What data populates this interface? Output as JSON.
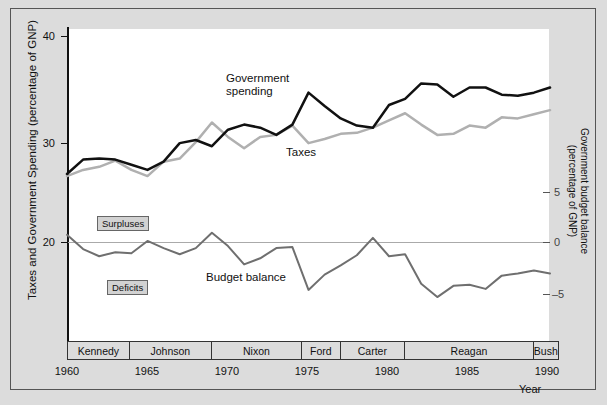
{
  "axes": {
    "left_title": "Taxes and Government Spending  (percentage of GNP)",
    "left_ticks": [
      "40",
      "30",
      "20"
    ],
    "right_title_line1": "Government budget balance",
    "right_title_line2": "(percentage of GNP)",
    "right_ticks": [
      "5",
      "0",
      "–5"
    ],
    "x_title": "Year",
    "x_ticks": [
      "1960",
      "1965",
      "1970",
      "1975",
      "1980",
      "1985",
      "1990"
    ]
  },
  "annotations": {
    "spending_line1": "Government",
    "spending_line2": "spending",
    "taxes": "Taxes",
    "budget_balance": "Budget balance",
    "surpluses": "Surpluses",
    "deficits": "Deficits"
  },
  "presidents": [
    {
      "name": "Kennedy",
      "start": 1960,
      "end": 1963.9
    },
    {
      "name": "Johnson",
      "start": 1963.9,
      "end": 1969
    },
    {
      "name": "Nixon",
      "start": 1969,
      "end": 1974.6
    },
    {
      "name": "Ford",
      "start": 1974.6,
      "end": 1977
    },
    {
      "name": "Carter",
      "start": 1977,
      "end": 1981
    },
    {
      "name": "Reagan",
      "start": 1981,
      "end": 1989
    },
    {
      "name": "Bush",
      "start": 1989,
      "end": 1990
    }
  ],
  "colors": {
    "spending": "#111111",
    "taxes": "#b0b0b0",
    "balance": "#6f6f6f",
    "frame": "#555555",
    "plot_bg": "#ffffff",
    "page_bg": "#dcdcdc"
  },
  "chart_data": {
    "type": "line",
    "title": "",
    "xlabel": "Year",
    "ylabel": "Taxes and Government Spending  (percentage of GNP)",
    "y2label": "Government budget balance (percentage of GNP)",
    "xlim": [
      1960,
      1990
    ],
    "ylim": [
      16.5,
      41.5
    ],
    "y2lim": [
      -8.5,
      6.5
    ],
    "yticks": [
      20,
      30,
      40
    ],
    "y2ticks": [
      -5,
      0,
      5
    ],
    "xticks": [
      1960,
      1965,
      1970,
      1975,
      1980,
      1985,
      1990
    ],
    "grid": false,
    "legend": "inline-annotations",
    "x": [
      1960,
      1961,
      1962,
      1963,
      1964,
      1965,
      1966,
      1967,
      1968,
      1969,
      1970,
      1971,
      1972,
      1973,
      1974,
      1975,
      1976,
      1977,
      1978,
      1979,
      1980,
      1981,
      1982,
      1983,
      1984,
      1985,
      1986,
      1987,
      1988,
      1989,
      1990
    ],
    "series": [
      {
        "name": "Government spending",
        "axis": "left",
        "color": "#111111",
        "values": [
          26.6,
          28.0,
          28.1,
          28.0,
          27.5,
          27.0,
          27.8,
          29.6,
          29.9,
          29.3,
          30.9,
          31.4,
          31.1,
          30.4,
          31.4,
          34.5,
          33.2,
          32.0,
          31.3,
          31.1,
          33.3,
          33.9,
          35.4,
          35.3,
          34.1,
          35.0,
          35.0,
          34.3,
          34.2,
          34.5,
          35.0
        ],
        "marker": "none",
        "linewidth": 2.5
      },
      {
        "name": "Taxes",
        "axis": "left",
        "color": "#b0b0b0",
        "values": [
          26.4,
          27.0,
          27.3,
          27.9,
          27.0,
          26.4,
          27.8,
          28.1,
          29.7,
          31.6,
          30.2,
          29.1,
          30.2,
          30.4,
          31.3,
          29.6,
          30.0,
          30.5,
          30.6,
          31.1,
          31.8,
          32.5,
          31.4,
          30.4,
          30.5,
          31.3,
          31.1,
          32.1,
          32.0,
          32.4,
          32.8
        ],
        "marker": "none",
        "linewidth": 2.5
      },
      {
        "name": "Budget balance",
        "axis": "right",
        "color": "#6f6f6f",
        "values": [
          0.8,
          -0.6,
          -1.3,
          -0.9,
          -1.0,
          0.2,
          -0.5,
          -1.1,
          -0.5,
          1.0,
          -0.3,
          -2.1,
          -1.5,
          -0.5,
          -0.4,
          -4.6,
          -3.1,
          -2.2,
          -1.2,
          0.5,
          -1.3,
          -1.1,
          -4.0,
          -5.3,
          -4.2,
          -4.1,
          -4.5,
          -3.2,
          -3.0,
          -2.7,
          -3.0
        ],
        "marker": "none",
        "linewidth": 2.0
      }
    ],
    "zero_reference_line": 0,
    "region_labels": [
      {
        "text": "Surpluses",
        "above_zero": true
      },
      {
        "text": "Deficits",
        "above_zero": false
      }
    ]
  }
}
